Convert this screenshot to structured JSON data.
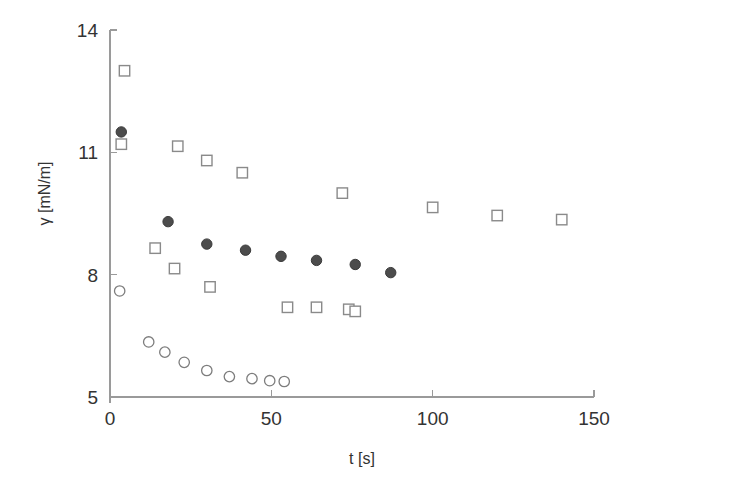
{
  "figure": {
    "title": "",
    "background_color": "#ffffff"
  },
  "axes": {
    "x": {
      "label": "t [s]",
      "ticks": [
        "0",
        "50",
        "100",
        "150"
      ],
      "tick_values": [
        0,
        50,
        100,
        150
      ],
      "min": 0,
      "max": 150
    },
    "y": {
      "label": "γ [mN/m]",
      "ticks": [
        "14",
        "11",
        "8",
        "5"
      ],
      "tick_values": [
        14,
        11,
        8,
        5
      ],
      "min": 5,
      "max": 14
    }
  },
  "colors": {
    "filled_circle": "#4c4c4c",
    "open_circle": "#7d7d7d",
    "open_square": "#8a8a8a",
    "axis": "#9a9a9a",
    "text": "#333333"
  },
  "chart_data": {
    "type": "scatter",
    "title": "",
    "xlabel": "t [s]",
    "ylabel": "γ [mN/m]",
    "xlim": [
      0,
      150
    ],
    "ylim": [
      5,
      14
    ],
    "grid": false,
    "legend_position": "none",
    "series": [
      {
        "name": "filled-circle-series",
        "marker": "filled-circle",
        "color": "#4c4c4c",
        "points": [
          {
            "x": 3.5,
            "y": 11.5
          },
          {
            "x": 18.0,
            "y": 9.3
          },
          {
            "x": 30.0,
            "y": 8.75
          },
          {
            "x": 42.0,
            "y": 8.6
          },
          {
            "x": 53.0,
            "y": 8.45
          },
          {
            "x": 64.0,
            "y": 8.35
          },
          {
            "x": 76.0,
            "y": 8.25
          },
          {
            "x": 87.0,
            "y": 8.05
          }
        ]
      },
      {
        "name": "open-square-series",
        "marker": "open-square",
        "color": "#8a8a8a",
        "points": [
          {
            "x": 4.5,
            "y": 13.0
          },
          {
            "x": 3.5,
            "y": 11.2
          },
          {
            "x": 14.0,
            "y": 8.65
          },
          {
            "x": 21.0,
            "y": 11.15
          },
          {
            "x": 20.0,
            "y": 8.15
          },
          {
            "x": 30.0,
            "y": 10.8
          },
          {
            "x": 31.0,
            "y": 7.7
          },
          {
            "x": 41.0,
            "y": 10.5
          },
          {
            "x": 55.0,
            "y": 7.2
          },
          {
            "x": 64.0,
            "y": 7.2
          },
          {
            "x": 72.0,
            "y": 10.0
          },
          {
            "x": 74.0,
            "y": 7.15
          },
          {
            "x": 76.0,
            "y": 7.1
          },
          {
            "x": 100.0,
            "y": 9.65
          },
          {
            "x": 120.0,
            "y": 9.45
          },
          {
            "x": 140.0,
            "y": 9.35
          }
        ]
      },
      {
        "name": "open-circle-series",
        "marker": "open-circle",
        "color": "#7d7d7d",
        "points": [
          {
            "x": 3.0,
            "y": 7.6
          },
          {
            "x": 12.0,
            "y": 6.35
          },
          {
            "x": 17.0,
            "y": 6.1
          },
          {
            "x": 23.0,
            "y": 5.85
          },
          {
            "x": 30.0,
            "y": 5.65
          },
          {
            "x": 37.0,
            "y": 5.5
          },
          {
            "x": 44.0,
            "y": 5.45
          },
          {
            "x": 49.5,
            "y": 5.4
          },
          {
            "x": 54.0,
            "y": 5.38
          }
        ]
      }
    ]
  }
}
